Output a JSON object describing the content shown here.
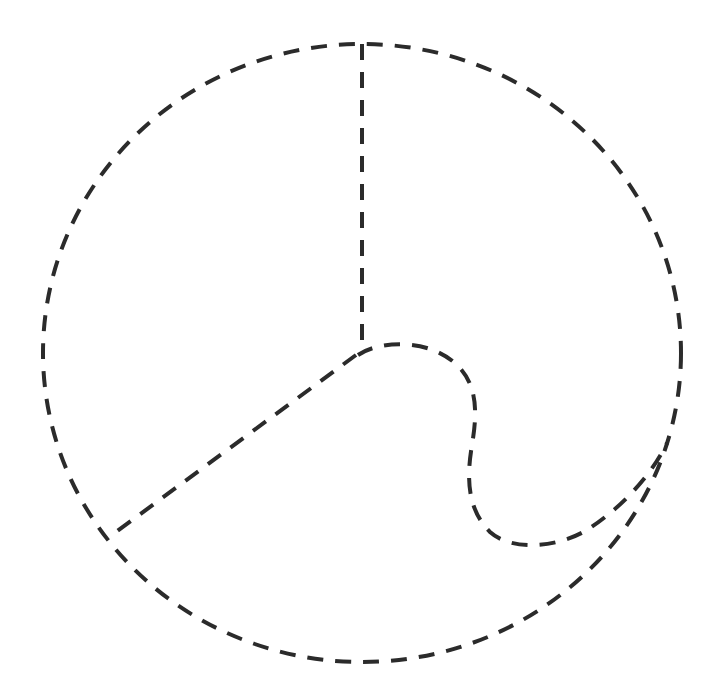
{
  "canvas": {
    "width": 716,
    "height": 697,
    "background": "#ffffff"
  },
  "style": {
    "stroke_color": "#2b2b2b",
    "stroke_width": 4,
    "dash": "16 12"
  },
  "shapes": {
    "outer_circle": {
      "cx": 362,
      "cy": 353,
      "rx": 319,
      "ry": 309
    },
    "vertical_radius": {
      "x1": 362,
      "y1": 44,
      "x2": 362,
      "y2": 340
    },
    "left_radius": {
      "x1": 356,
      "y1": 355,
      "x2": 116,
      "y2": 532
    },
    "s_curve": {
      "d": "M 358 355 C 380 340, 430 338, 458 366 C 480 388, 476 420, 472 445 C 466 480, 468 510, 490 532 C 512 552, 560 548, 590 528 C 620 508, 650 478, 667 443"
    }
  }
}
